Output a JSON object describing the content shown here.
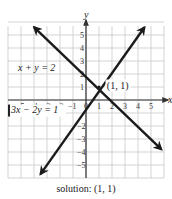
{
  "chart_data": {
    "type": "line",
    "title": "",
    "xlabel": "x",
    "ylabel": "y",
    "xlim": [
      -6,
      6
    ],
    "ylim": [
      -6,
      6
    ],
    "grid": true,
    "x_ticks": [
      -5,
      -4,
      -3,
      -2,
      -1,
      0,
      1,
      2,
      3,
      4,
      5
    ],
    "y_ticks": [
      -5,
      -4,
      -3,
      -2,
      1,
      2,
      3,
      4,
      5
    ],
    "series": [
      {
        "name": "x + y = 2",
        "equation": "y = 2 - x",
        "points": [
          [
            -4,
            6
          ],
          [
            6,
            -4
          ]
        ]
      },
      {
        "name": "3x - 2y = 1",
        "equation": "y = (3x - 1)/2",
        "points": [
          [
            -3.67,
            -6
          ],
          [
            4.33,
            6
          ]
        ]
      }
    ],
    "annotations": [
      {
        "text": "(1, 1)",
        "x": 1,
        "y": 1
      },
      {
        "text": "x + y = 2",
        "x": -4.5,
        "y": 2.5
      },
      {
        "text": "3x − 2y = 1",
        "x": -4.5,
        "y": -0.8
      }
    ],
    "caption": "solution: (1, 1)"
  },
  "labels": {
    "x_axis": "x",
    "y_axis": "y",
    "eq1": "x + y = 2",
    "eq2": "3x − 2y = 1",
    "point": "(1, 1)",
    "caption": "solution: (1, 1)"
  }
}
